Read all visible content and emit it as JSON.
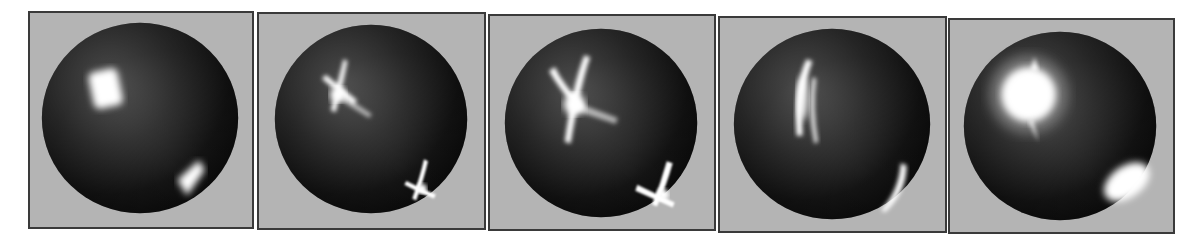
{
  "figure": {
    "panels": [
      {
        "id": 1,
        "highlight_type": "soft-square",
        "label": ""
      },
      {
        "id": 2,
        "highlight_type": "cross-star",
        "label": ""
      },
      {
        "id": 3,
        "highlight_type": "cross-star-large",
        "label": ""
      },
      {
        "id": 4,
        "highlight_type": "vertical-streak",
        "label": ""
      },
      {
        "id": 5,
        "highlight_type": "broad-glow",
        "label": ""
      }
    ],
    "colors": {
      "background": "#ffffff",
      "panel_bg": "#b4b4b4",
      "panel_border": "#3a3a3a",
      "sphere_light": "#6e6e6e",
      "sphere_dark": "#0e0e0e",
      "highlight": "#ffffff"
    }
  }
}
